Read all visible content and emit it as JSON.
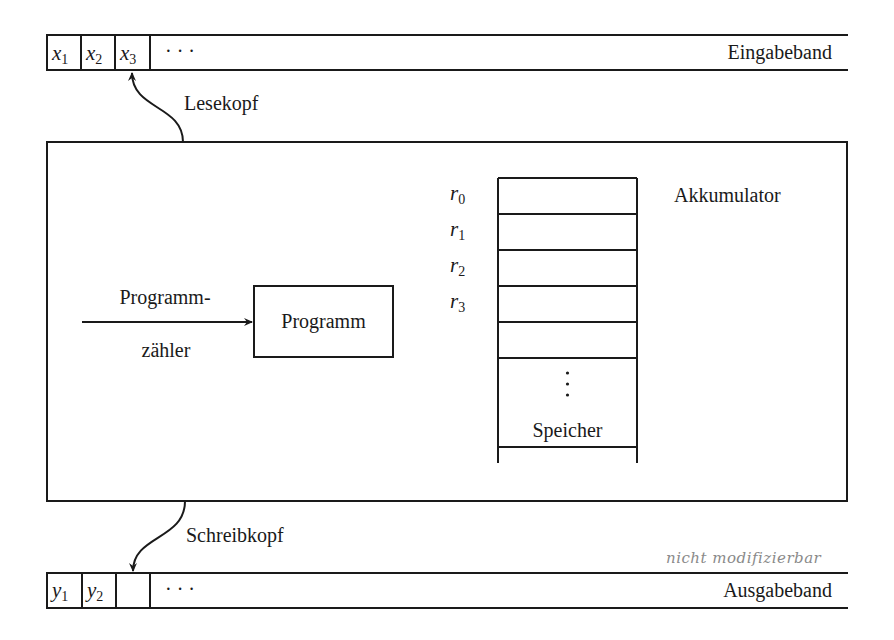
{
  "input_tape": {
    "label": "Eingabeband",
    "cells": [
      {
        "sym": "x",
        "idx": "1"
      },
      {
        "sym": "x",
        "idx": "2"
      },
      {
        "sym": "x",
        "idx": "3"
      }
    ],
    "ellipsis": "· · ·"
  },
  "read_head": {
    "label": "Lesekopf"
  },
  "machine": {
    "program": {
      "label": "Programm"
    },
    "program_counter": {
      "label_line1": "Programm-",
      "label_line2": "zähler"
    },
    "registers": [
      {
        "sym": "r",
        "idx": "0"
      },
      {
        "sym": "r",
        "idx": "1"
      },
      {
        "sym": "r",
        "idx": "2"
      },
      {
        "sym": "r",
        "idx": "3"
      }
    ],
    "accumulator_label": "Akkumulator",
    "memory_vdots": "⋮",
    "memory_label": "Speicher"
  },
  "write_head": {
    "label": "Schreibkopf"
  },
  "output_tape": {
    "label": "Ausgabeband",
    "cells": [
      {
        "sym": "y",
        "idx": "1"
      },
      {
        "sym": "y",
        "idx": "2"
      },
      {
        "sym": "",
        "idx": ""
      }
    ],
    "ellipsis": "· · ·",
    "annotation": "nicht modifizierbar"
  }
}
